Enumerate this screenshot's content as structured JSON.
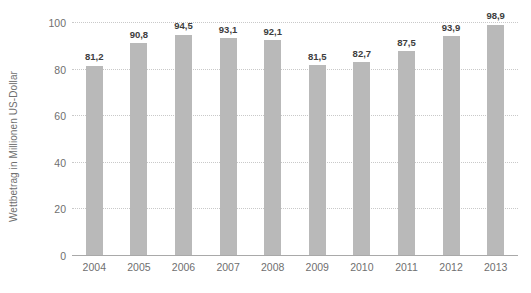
{
  "chart_data": {
    "type": "bar",
    "title": "",
    "subtitle": "",
    "xlabel": "",
    "ylabel": "Wettbetrag in Millionen US-Dollar",
    "categories": [
      "2004",
      "2005",
      "2006",
      "2007",
      "2008",
      "2009",
      "2010",
      "2011",
      "2012",
      "2013"
    ],
    "values": [
      81.2,
      90.8,
      94.5,
      93.1,
      92.1,
      81.5,
      82.7,
      87.5,
      93.9,
      98.9
    ],
    "value_labels": [
      "81,2",
      "90,8",
      "94,5",
      "93,1",
      "92,1",
      "81,5",
      "82,7",
      "87,5",
      "93,9",
      "98,9"
    ],
    "ylim": [
      0,
      100
    ],
    "yticks": [
      0,
      20,
      40,
      60,
      80,
      100
    ],
    "ytick_labels": [
      "0",
      "20",
      "40",
      "60",
      "80",
      "100"
    ],
    "grid": true,
    "legend": null,
    "series": [
      {
        "name": "Wettbetrag",
        "values": [
          81.2,
          90.8,
          94.5,
          93.1,
          92.1,
          81.5,
          82.7,
          87.5,
          93.9,
          98.9
        ]
      }
    ],
    "colors": {
      "bar": "#b9b9b9",
      "gridline": "#c9c9c9",
      "axis_line": "#a9a9a9",
      "tick_label": "#6f6f6f",
      "value_label": "#3d3d3d",
      "background": "#ffffff"
    }
  }
}
